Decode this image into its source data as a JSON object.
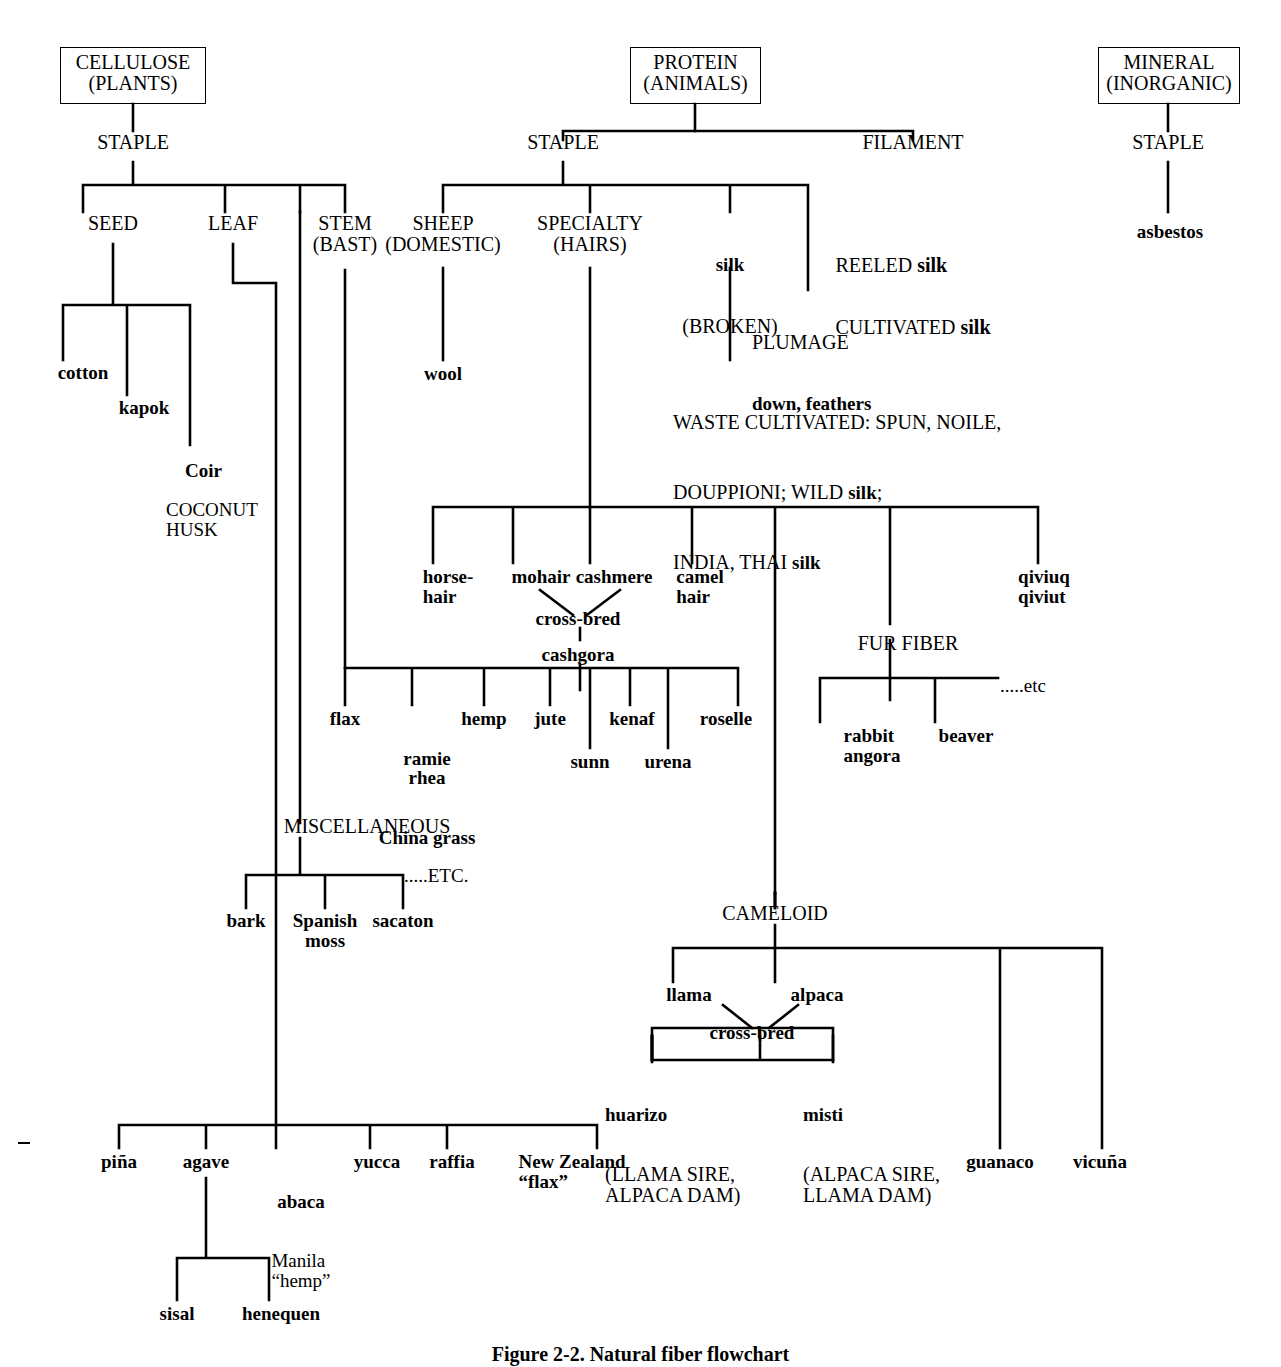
{
  "figure": {
    "caption": "Figure 2-2.   Natural fiber flowchart"
  },
  "roots": {
    "cellulose": "CELLULOSE\n(PLANTS)",
    "protein": "PROTEIN\n(ANIMALS)",
    "mineral": "MINERAL\n(INORGANIC)"
  },
  "cellulose_branch": {
    "staple": "STAPLE",
    "seed": "SEED",
    "leaf": "LEAF",
    "stem": "STEM\n(BAST)",
    "seed_children": {
      "cotton": "cotton",
      "kapok": "kapok",
      "coir_bold": "Coir",
      "coir_caps": "COCONUT\nHUSK"
    },
    "bast_children": {
      "flax": "flax",
      "ramie_bold": "ramie\nrhea",
      "ramie_caps": "China grass",
      "hemp": "hemp",
      "jute": "jute",
      "sunn": "sunn",
      "kenaf": "kenaf",
      "urena": "urena",
      "roselle": "roselle"
    },
    "miscellaneous": {
      "label": "MISCELLANEOUS",
      "etc": ".....ETC.",
      "children": [
        "bark",
        "Spanish\nmoss",
        "sacaton"
      ]
    },
    "leaf_children": {
      "pina": "piña",
      "agave": "agave",
      "abaca_bold": "abaca",
      "abaca_caps": "Manila\n“hemp”",
      "yucca": "yucca",
      "raffia": "raffia",
      "nz_flax": "New Zealand\n“flax”",
      "agave_children": [
        "sisal",
        "henequen"
      ]
    }
  },
  "protein_branch": {
    "staple": "STAPLE",
    "filament": "FILAMENT",
    "filament_children": "REELED silk\nCULTIVATED silk",
    "filament_lines": [
      {
        "caps": "REELED ",
        "bold": "silk"
      },
      {
        "caps": "CULTIVATED ",
        "bold": "silk"
      }
    ],
    "sheep": "SHEEP\n(DOMESTIC)",
    "sheep_child": "wool",
    "specialty": "SPECIALTY\n(HAIRS)",
    "silk_broken_bold": "silk",
    "silk_broken_caps": "(BROKEN)",
    "plumage_caps": "PLUMAGE",
    "plumage_bold": "down, feathers",
    "waste_silk_lines": [
      {
        "caps": "WASTE CULTIVATED: SPUN, NOILE,",
        "bold": ""
      },
      {
        "caps": "DOUPPIONI; WILD ",
        "bold": "silk",
        "tail": ";"
      },
      {
        "caps": "INDIA, THAI ",
        "bold": "silk"
      }
    ],
    "hairs": {
      "horsehair": "horse-\nhair",
      "mohair": "mohair",
      "cashmere": "cashmere",
      "crossbred": "cross-bred",
      "cashgora": "cashgora",
      "camel": "camel\nhair",
      "qiviuq": "qiviuq\nqiviut"
    },
    "fur_fiber": {
      "label": "FUR FIBER",
      "etc": ".....etc",
      "children": [
        "rabbit\nangora",
        "beaver"
      ]
    },
    "cameloid": {
      "label": "CAMELOID",
      "llama": "llama",
      "alpaca": "alpaca",
      "crossbred": "cross-bred",
      "huarizo_bold": "huarizo",
      "huarizo_caps": "(LLAMA SIRE,\nALPACA DAM)",
      "misti_bold": "misti",
      "misti_caps": "(ALPACA SIRE,\nLLAMA DAM)",
      "guanaco": "guanaco",
      "vicuna": "vicuña"
    }
  },
  "mineral_branch": {
    "staple": "STAPLE",
    "asbestos": "asbestos"
  },
  "style": {
    "ink": "#000000",
    "paper": "#ffffff"
  }
}
